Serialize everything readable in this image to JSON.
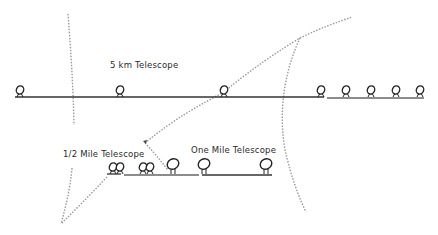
{
  "diagram": {
    "labels": {
      "five_km": "5 km   Telescope",
      "half_mile": "1/2 Mile Telescope",
      "one_mile": "One Mile Telescope"
    },
    "arrays": [
      {
        "name": "5 km Telescope",
        "baseline_y": 97,
        "x_start": 15,
        "x_end": 325,
        "telescopes_x": [
          20,
          120,
          224,
          320,
          345,
          370,
          395,
          420
        ]
      },
      {
        "name": "1/2 Mile Telescope",
        "baseline_y": 173,
        "x_start": 107,
        "x_end": 200,
        "telescopes_x": [
          112,
          120,
          143,
          150,
          173
        ]
      },
      {
        "name": "One Mile Telescope",
        "baseline_y": 173,
        "x_start": 200,
        "x_end": 270,
        "telescopes_x": [
          203,
          265
        ]
      }
    ],
    "colors": {
      "line": "#333333",
      "dashed": "#999999",
      "background": "#ffffff"
    }
  }
}
